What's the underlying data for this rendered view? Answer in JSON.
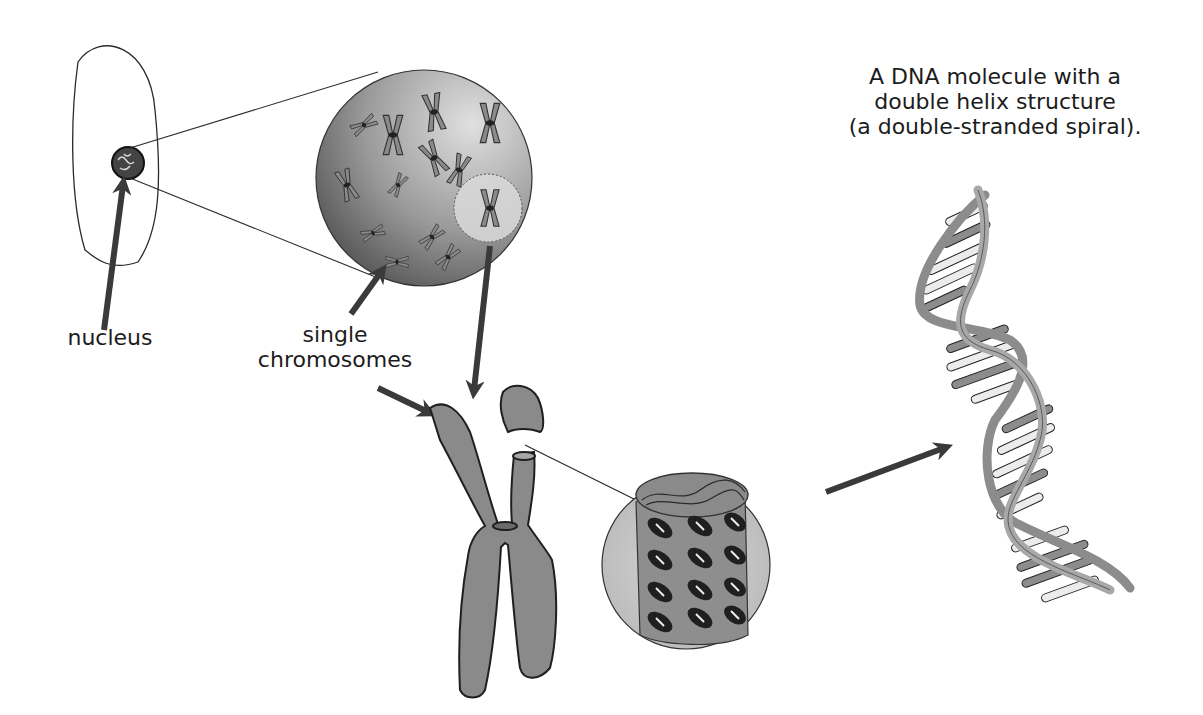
{
  "diagram": {
    "type": "biology-illustration",
    "topic": "DNA packaging from cell nucleus to double helix",
    "labels": {
      "nucleus": "nucleus",
      "single_chromosomes_line1": "single",
      "single_chromosomes_line2": "chromosomes",
      "dna_title_line1": "A DNA molecule with a",
      "dna_title_line2": "double helix structure",
      "dna_title_line3": "(a double-stranded spiral)."
    },
    "elements": [
      {
        "id": "cell",
        "description": "cell outline with nucleus"
      },
      {
        "id": "nucleus-magnified",
        "description": "magnified nucleus showing scattered chromosomes"
      },
      {
        "id": "single-chromosome",
        "description": "enlarged single chromosome with cut-away top"
      },
      {
        "id": "chromatin-cylinder",
        "description": "cross-section showing coiled DNA packed in chromatin"
      },
      {
        "id": "double-helix",
        "description": "DNA double helix with base pairs"
      }
    ],
    "colors": {
      "outline": "#222222",
      "chromosome_fill": "#8a8a8a",
      "nucleus_sphere_dark": "#5a5a5a",
      "nucleus_sphere_light": "#cfcfcf",
      "arrow": "#3a3a3a",
      "helix_strand": "#9a9a9a",
      "base_dark": "#8c8c8c",
      "base_light": "#ececec"
    }
  }
}
